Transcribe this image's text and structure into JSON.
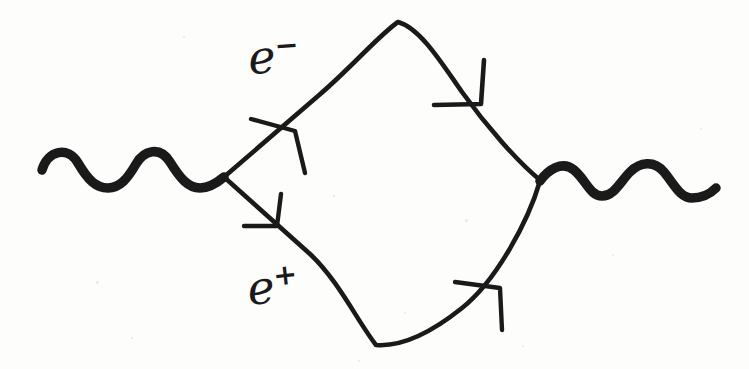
{
  "figure": {
    "kind": "feynman-diagram",
    "background_color": "#fdfdfc",
    "ink_color": "#1a1a1a",
    "width": 749,
    "height": 369
  },
  "labels": {
    "electron": {
      "base": "e",
      "charge": "−",
      "full": "e−"
    },
    "positron": {
      "base": "e",
      "charge": "+",
      "full": "e+"
    }
  },
  "elements": {
    "photon_in": {
      "name": "incoming photon",
      "style": "wavy",
      "start_x": 42,
      "start_y": 168,
      "end_x": 224,
      "end_y": 177,
      "waves": 3.5
    },
    "photon_out": {
      "name": "outgoing photon",
      "style": "wavy",
      "start_x": 540,
      "start_y": 180,
      "end_x": 716,
      "end_y": 190,
      "waves": 3.5
    },
    "vertex_left": {
      "name": "left vertex",
      "x": 224,
      "y": 177
    },
    "vertex_right": {
      "name": "right vertex",
      "x": 540,
      "y": 180
    },
    "loop_top_apex": {
      "name": "loop top apex",
      "x": 398,
      "y": 22
    },
    "loop_bottom_apex": {
      "name": "loop bottom apex",
      "x": 376,
      "y": 345
    },
    "fermion_upper_left": {
      "name": "electron line, upper left branch",
      "from": "vertex_left",
      "to": "loop_top_apex"
    },
    "fermion_upper_right": {
      "name": "electron line, upper right branch",
      "from": "loop_top_apex",
      "to": "vertex_right"
    },
    "fermion_lower_left": {
      "name": "positron line, lower left branch",
      "from": "vertex_left",
      "to": "loop_bottom_apex"
    },
    "fermion_lower_right": {
      "name": "positron line, lower right branch",
      "from": "loop_bottom_apex",
      "to": "vertex_right"
    }
  },
  "arrows": [
    {
      "id": "arrow-upper-left",
      "x": 289,
      "y": 120,
      "angle": -41,
      "direction": "up-right",
      "on": "fermion_upper_left"
    },
    {
      "id": "arrow-upper-right",
      "x": 473,
      "y": 100,
      "angle": 49,
      "direction": "down-right",
      "on": "fermion_upper_right"
    },
    {
      "id": "arrow-lower-left",
      "x": 271,
      "y": 221,
      "angle": 40,
      "direction": "down-right",
      "on": "fermion_lower_left"
    },
    {
      "id": "arrow-lower-right",
      "x": 490,
      "y": 286,
      "angle": -54,
      "direction": "up-right",
      "on": "fermion_lower_right"
    }
  ],
  "specks": [
    {
      "x": 96,
      "y": 281,
      "d": 3
    },
    {
      "x": 183,
      "y": 36,
      "d": 2
    },
    {
      "x": 269,
      "y": 64,
      "d": 2
    },
    {
      "x": 275,
      "y": 44,
      "d": 2
    },
    {
      "x": 333,
      "y": 195,
      "d": 2
    },
    {
      "x": 404,
      "y": 312,
      "d": 2
    },
    {
      "x": 465,
      "y": 219,
      "d": 3
    },
    {
      "x": 522,
      "y": 345,
      "d": 2
    },
    {
      "x": 612,
      "y": 254,
      "d": 2
    },
    {
      "x": 700,
      "y": 128,
      "d": 2
    },
    {
      "x": 131,
      "y": 337,
      "d": 2
    },
    {
      "x": 358,
      "y": 360,
      "d": 2
    }
  ]
}
